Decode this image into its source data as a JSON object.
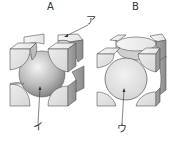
{
  "figure": {
    "panels": [
      {
        "id": "A",
        "label": "A",
        "structure": "body-centered cubic"
      },
      {
        "id": "B",
        "label": "B",
        "structure": "face-centered cubic"
      }
    ],
    "callouts": [
      {
        "id": "a",
        "text": "ア",
        "points_to": "corner atom of cube A"
      },
      {
        "id": "i",
        "text": "イ",
        "points_to": "center atom of cube A"
      },
      {
        "id": "u",
        "text": "ウ",
        "points_to": "face-center atom of cube B"
      }
    ]
  }
}
